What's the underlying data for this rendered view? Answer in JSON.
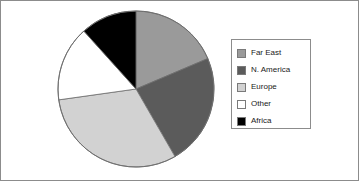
{
  "chart_data": {
    "type": "pie",
    "title": "",
    "categories": [
      "Far East",
      "N. America",
      "Europe",
      "Other",
      "Africa"
    ],
    "values": [
      18.5,
      23.0,
      31.0,
      15.5,
      12.0
    ],
    "units": "percent",
    "start_angle_deg": 0,
    "direction": "clockwise",
    "colors": [
      "#9a9a9a",
      "#5b5b5b",
      "#d2d2d2",
      "#ffffff",
      "#000000"
    ],
    "slice_boundaries_deg": [
      0,
      67,
      150,
      262,
      318,
      360
    ],
    "legend": {
      "position": "right",
      "border_color": "#8c8c8c",
      "entries": [
        {
          "label": "Far East",
          "color": "#9a9a9a"
        },
        {
          "label": "N. America",
          "color": "#5b5b5b"
        },
        {
          "label": "Europe",
          "color": "#d2d2d2"
        },
        {
          "label": "Other",
          "color": "#ffffff"
        },
        {
          "label": "Africa",
          "color": "#000000"
        }
      ]
    },
    "grid": false,
    "xlabel": "",
    "ylabel": ""
  },
  "frame": {
    "border_color": "#8c8c8c",
    "background": "#ffffff"
  },
  "pie": {
    "center_x": 135,
    "center_y": 88,
    "radius": 78,
    "outline_color": "#6e6e6e"
  }
}
